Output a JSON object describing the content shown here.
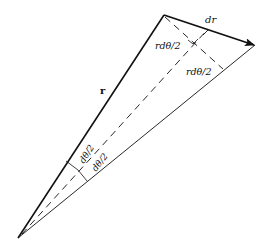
{
  "diagram": {
    "colors": {
      "stroke": "#111111",
      "background": "#ffffff"
    },
    "labels": {
      "r": "r",
      "dr": "dr",
      "r_dtheta_half_upper": "rdθ/2",
      "r_dtheta_half_lower": "rdθ/2",
      "dtheta_half_upper": "dθ/2",
      "dtheta_half_lower": "dθ/2"
    },
    "points": {
      "origin": [
        18,
        238
      ],
      "r_tip": [
        164,
        15
      ],
      "r_plus_dr_tip": [
        255,
        45
      ]
    }
  }
}
